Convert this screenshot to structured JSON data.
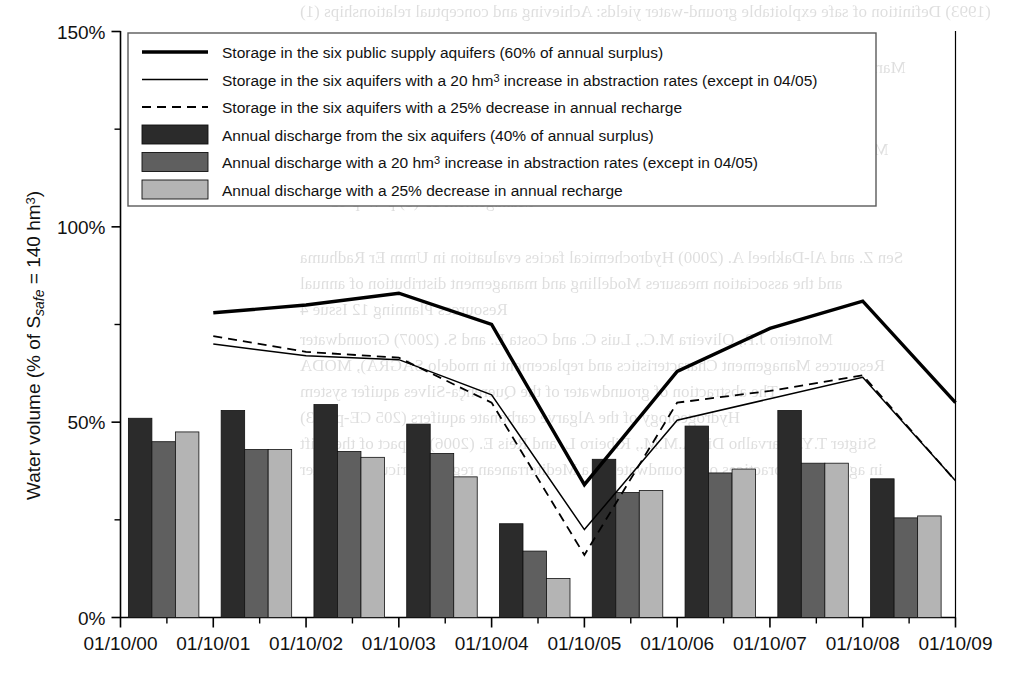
{
  "chart_data": {
    "type": "bar",
    "title": "",
    "subtitle": "",
    "xlabel": "",
    "ylabel": "Water volume (% of S",
    "ylabel_sub": "safe",
    "ylabel_tail": " = 140 hm",
    "ylabel_sup": "3",
    "ylabel_end": ")",
    "ylabel_full": "Water volume (% of Ssafe = 140 hm3)",
    "categories": [
      "01/10/00",
      "01/10/01",
      "01/10/02",
      "01/10/03",
      "01/10/04",
      "01/10/05",
      "01/10/06",
      "01/10/07",
      "01/10/08",
      "01/10/09"
    ],
    "ylim": [
      0,
      150
    ],
    "yticks": [
      0,
      50,
      100,
      150
    ],
    "ytick_labels": [
      "0%",
      "50%",
      "100%",
      "150%"
    ],
    "yminor_ticks": [
      25,
      75,
      125
    ],
    "grid": false,
    "legend_position": "top-left-inside",
    "bar_x": [
      "01/10/00",
      "01/10/01",
      "01/10/02",
      "01/10/03",
      "01/10/04",
      "01/10/05",
      "01/10/06",
      "01/10/07",
      "01/10/08"
    ],
    "bar_series": [
      {
        "name": "Annual discharge from the six aquifers (40% of annual surplus)",
        "color": "#2b2b2b",
        "values": [
          51,
          53,
          54.5,
          49.5,
          24,
          40.5,
          49,
          53,
          35.5
        ]
      },
      {
        "name": "Annual discharge with a 20 hm3 increase in abstraction rates (except in 04/05)",
        "color": "#5f5f5f",
        "values": [
          45,
          43,
          42.5,
          42,
          17,
          32,
          37,
          39.5,
          25.5
        ]
      },
      {
        "name": "Annual discharge with a 25% decrease in annual recharge",
        "color": "#b4b4b4",
        "values": [
          47.5,
          43,
          41,
          36,
          10,
          32.5,
          38,
          39.5,
          26
        ]
      }
    ],
    "line_series": [
      {
        "name": "Storage in the six public supply aquifers (60% of annual surplus)",
        "style": "solid-thick",
        "color": "#000000",
        "x": [
          "01/10/01",
          "01/10/02",
          "01/10/03",
          "01/10/04",
          "01/10/05",
          "01/10/06",
          "01/10/07",
          "01/10/08",
          "01/10/09"
        ],
        "values": [
          78,
          80,
          83,
          75,
          34,
          63,
          74,
          81,
          55
        ]
      },
      {
        "name": "Storage in the six aquifers with a 20 hm3 increase in abstraction rates (except in 04/05)",
        "style": "solid-thin",
        "color": "#000000",
        "x": [
          "01/10/01",
          "01/10/02",
          "01/10/03",
          "01/10/04",
          "01/10/05",
          "01/10/06",
          "01/10/07",
          "01/10/08",
          "01/10/09"
        ],
        "values": [
          70,
          67,
          66,
          57,
          22.5,
          50.5,
          56,
          61.5,
          35
        ]
      },
      {
        "name": "Storage in the six aquifers with a 25% decrease in annual recharge",
        "style": "dashed-thin",
        "color": "#000000",
        "x": [
          "01/10/01",
          "01/10/02",
          "01/10/03",
          "01/10/04",
          "01/10/05",
          "01/10/06",
          "01/10/07",
          "01/10/08",
          "01/10/09"
        ],
        "values": [
          72,
          68,
          66.5,
          55,
          16,
          55,
          58,
          62,
          35
        ]
      }
    ]
  },
  "legend": {
    "items": [
      {
        "label": "Storage in the six public supply aquifers (60% of annual surplus)",
        "kind": "line",
        "style": "solid-thick"
      },
      {
        "label": "Storage in the six aquifers with a 20 hm³ increase in abstraction rates (except in 04/05)",
        "kind": "line",
        "style": "solid-thin"
      },
      {
        "label": "Storage in the six aquifers with a 25% decrease in annual recharge",
        "kind": "line",
        "style": "dashed-thin"
      },
      {
        "label": "Annual discharge from the six aquifers (40% of annual surplus)",
        "kind": "swatch",
        "color": "#2b2b2b"
      },
      {
        "label": "Annual discharge with a 20 hm³ increase in abstraction rates (except in 04/05)",
        "kind": "swatch",
        "color": "#5f5f5f"
      },
      {
        "label": "Annual discharge with a 25% decrease in annual recharge",
        "kind": "swatch",
        "color": "#b4b4b4"
      }
    ]
  },
  "yaxis": {
    "labels": [
      "150%",
      "100%",
      "50%",
      "0%"
    ]
  },
  "xaxis": {
    "labels": [
      "01/10/00",
      "01/10/01",
      "01/10/02",
      "01/10/03",
      "01/10/04",
      "01/10/05",
      "01/10/06",
      "01/10/07",
      "01/10/08",
      "01/10/09"
    ]
  },
  "ylabel_parts": {
    "head": "Water volume (% of S",
    "sub": "safe",
    "mid": " = 140 hm",
    "sup": "3",
    "tail": ")"
  },
  "bleed_text": [
    "(1993) Definition of safe exploitable ground-water yields: Achieving and conceptual relationships (1)",
    "Marianne I.E. Bahero aquifer matrix—hydro-Water-Resources Planning 117 173-X 1941",
    "European Commission, Brussels",
    "Monteiro J.P., Nunes L., Vieira J. and Stigter T. (2006) Sustainable Regional Flow",
    "Modelling of the Querença-Silves aquifer (Algarve, Portugal) Water Resources",
    "Management 19 (1) p 47-p 63",
    "Sen Z. and Al-Dakheel A. (2000) Hydrochemical facies evaluation in Umm Er Radhuma",
    "and the association measures Modelling and management distribution of annual",
    "Resources Planning 12 Issue 4",
    "Monteiro J.P., Oliveira M.C., Luis C. and Costa L. and S. (2007) Groundwater",
    "Resources Management Characteristics and replacement in modelo SAGRA), MODA",
    "The abstraction of groundwater of the Querença-Silves aquifer system",
    "Hydrogeology of the Algarve carbonate aquifers (205 CE-p 123)",
    "Stigter T.Y., Carvalho Dill A.M.M., Ribeiro L. and Reis E. (2006) Impact of the shift",
    "in agricultural practices on groundwater in a Mediterranean region Agricultural Water",
    "Management 80 p 110-p 121"
  ]
}
